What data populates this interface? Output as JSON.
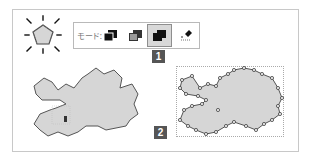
{
  "toolbar": {
    "mode_label": "モード:",
    "tools": [
      {
        "name": "union",
        "icon": "union-mode-icon",
        "active": false
      },
      {
        "name": "subtract",
        "icon": "subtract-mode-icon",
        "active": false
      },
      {
        "name": "intersect",
        "icon": "intersect-mode-icon",
        "active": true
      },
      {
        "name": "eraser",
        "icon": "eraser-mode-icon",
        "active": false
      }
    ]
  },
  "callouts": {
    "step1": "1",
    "step2": "2"
  },
  "colors": {
    "shape_fill": "#d6d6d6",
    "shape_stroke": "#555555",
    "badge_bg": "#555555",
    "active_tool_bg": "#d8d8d8"
  }
}
